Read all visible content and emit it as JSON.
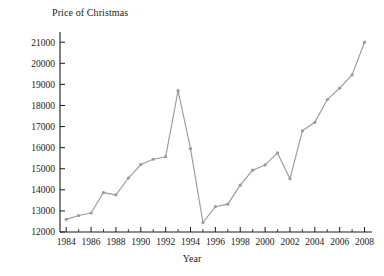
{
  "chart_data": {
    "type": "line",
    "title": "Price of Christmas",
    "xlabel": "Year",
    "ylabel": "",
    "xlim": [
      1983.5,
      2008.6
    ],
    "ylim": [
      12000,
      21200
    ],
    "grid": false,
    "legend": "none",
    "line_color": "#9a9a9a",
    "marker_color": "#9a9a9a",
    "axis_color": "#1a1a1a",
    "x": [
      1984,
      1985,
      1986,
      1987,
      1988,
      1989,
      1990,
      1991,
      1992,
      1993,
      1994,
      1995,
      1996,
      1997,
      1998,
      1999,
      2000,
      2001,
      2002,
      2003,
      2004,
      2005,
      2006,
      2007,
      2008
    ],
    "values": [
      12600,
      12780,
      12900,
      13870,
      13760,
      14560,
      15200,
      15450,
      15570,
      18700,
      15950,
      12450,
      13200,
      13320,
      14220,
      14930,
      15180,
      15750,
      14520,
      16800,
      17200,
      18280,
      18820,
      19450,
      21000
    ],
    "xticks": [
      1984,
      1986,
      1988,
      1990,
      1992,
      1994,
      1996,
      1998,
      2000,
      2002,
      2004,
      2006,
      2008
    ],
    "xtick_labels": [
      "1984",
      "1986",
      "1988",
      "1990",
      "1992",
      "1994",
      "1996",
      "1998",
      "2000",
      "2002",
      "2004",
      "2006",
      "2008"
    ],
    "xticks_minor": [
      1985,
      1987,
      1989,
      1991,
      1993,
      1995,
      1997,
      1999,
      2001,
      2003,
      2005,
      2007
    ],
    "yticks": [
      12000,
      13000,
      14000,
      15000,
      16000,
      17000,
      18000,
      19000,
      20000,
      21000
    ],
    "ytick_labels": [
      "12000",
      "13000",
      "14000",
      "15000",
      "16000",
      "17000",
      "18000",
      "19000",
      "20000",
      "21000"
    ]
  }
}
